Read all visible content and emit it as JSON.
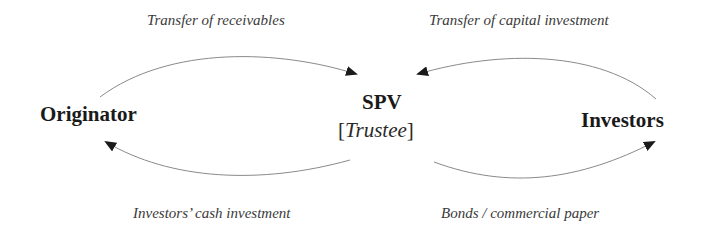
{
  "nodes": {
    "originator": "Originator",
    "spv": "SPV",
    "spv_role_open": "[",
    "spv_role": "Trustee",
    "spv_role_close": "]",
    "investors": "Investors"
  },
  "edges": {
    "originator_to_spv": "Transfer of receivables",
    "investors_to_spv": "Transfer of capital investment",
    "spv_to_originator": "Investors’ cash investment",
    "spv_to_investors": "Bonds / commercial paper"
  },
  "colors": {
    "line": "#8a8a8a",
    "arrowhead": "#1a1a1a",
    "node_text": "#1a1a1a",
    "label_text": "#3a3a3a"
  }
}
